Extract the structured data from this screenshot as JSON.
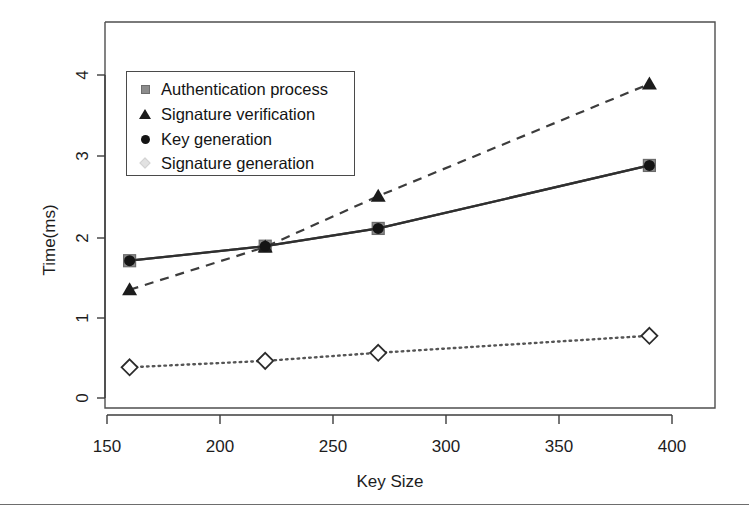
{
  "chart_data": {
    "type": "line",
    "title": "",
    "xlabel": "Key Size",
    "ylabel": "Time(ms)",
    "x": [
      160,
      220,
      270,
      390
    ],
    "xlim": [
      140,
      410
    ],
    "ylim": [
      -0.15,
      4.45
    ],
    "xticks": [
      150,
      200,
      250,
      300,
      350,
      400
    ],
    "yticks": [
      0,
      1,
      2,
      3,
      4
    ],
    "xtick_labels": [
      "150",
      "200",
      "250",
      "300",
      "350",
      "400"
    ],
    "ytick_labels": [
      "0",
      "1",
      "2",
      "3",
      "4"
    ],
    "grid": false,
    "legend_position": "top-left",
    "series": [
      {
        "name": "Authentication process",
        "marker": "square",
        "marker_color": "#8c8c8c",
        "line_style": "solid",
        "line_color": "#4a4a4a",
        "values": [
          1.7,
          1.88,
          2.1,
          2.88
        ]
      },
      {
        "name": "Signature verification",
        "marker": "triangle",
        "marker_color": "#1c1c1c",
        "line_style": "dashed",
        "line_color": "#3c3c3c",
        "values": [
          1.34,
          1.87,
          2.5,
          3.89
        ]
      },
      {
        "name": "Key generation",
        "marker": "circle",
        "marker_color": "#141414",
        "line_style": "solid",
        "line_color": "#2f2f2f",
        "values": [
          1.7,
          1.88,
          2.1,
          2.88
        ]
      },
      {
        "name": "Signature generation",
        "marker": "diamond",
        "marker_color": "#e2e2e2",
        "line_style": "dotted",
        "line_color": "#555555",
        "values": [
          0.38,
          0.46,
          0.56,
          0.77
        ]
      }
    ]
  },
  "axes": {
    "x_title": "Key Size",
    "y_title": "Time(ms)",
    "x_tick_0": "150",
    "x_tick_1": "200",
    "x_tick_2": "250",
    "x_tick_3": "300",
    "x_tick_4": "350",
    "x_tick_5": "400",
    "y_tick_0": "0",
    "y_tick_1": "1",
    "y_tick_2": "2",
    "y_tick_3": "3",
    "y_tick_4": "4"
  },
  "legend": {
    "items": [
      {
        "label": "Authentication process",
        "marker": "square-marker-icon"
      },
      {
        "label": "Signature verification",
        "marker": "triangle-marker-icon"
      },
      {
        "label": "Key generation",
        "marker": "circle-marker-icon"
      },
      {
        "label": "Signature generation",
        "marker": "diamond-marker-icon"
      }
    ]
  }
}
